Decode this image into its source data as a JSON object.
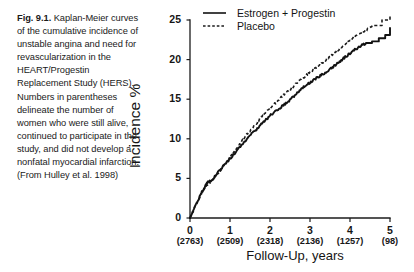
{
  "caption": {
    "figure_label": "Fig. 9.1.",
    "text": "Kaplan-Meier curves of the cumulative incidence of unstable angina and need for revascularization in the HEART/Progestin Replacement Study (HERS). Numbers in parentheses delineate the number of women who were still alive, continued to participate in the study, and did not develop a nonfatal myocardial infarction. (From Hulley et al. 1998)"
  },
  "chart_data": {
    "type": "line",
    "title": "",
    "xlabel": "Follow-Up,  years",
    "ylabel": "Incidence %",
    "xlim": [
      0,
      5
    ],
    "ylim": [
      0,
      25
    ],
    "xticks": [
      0,
      1,
      2,
      3,
      4,
      5
    ],
    "xtick_labels": [
      "0",
      "1",
      "2",
      "3",
      "4",
      "5"
    ],
    "yticks": [
      0,
      5,
      10,
      15,
      20,
      25
    ],
    "ytick_labels": [
      "0",
      "5",
      "10",
      "15",
      "20",
      "25"
    ],
    "grid": false,
    "legend_position": "top-center",
    "at_risk_label_row": [
      "(2763)",
      "(2509)",
      "(2318)",
      "(2136)",
      "(1257)",
      "(98)"
    ],
    "series": [
      {
        "name": "Estrogen + Progestin",
        "style": "solid",
        "x": [
          0.0,
          0.1,
          0.2,
          0.3,
          0.38,
          0.45,
          0.52,
          0.6,
          0.7,
          0.8,
          0.9,
          1.0,
          1.1,
          1.2,
          1.3,
          1.4,
          1.5,
          1.6,
          1.7,
          1.8,
          1.9,
          2.0,
          2.1,
          2.2,
          2.3,
          2.4,
          2.5,
          2.6,
          2.7,
          2.8,
          2.9,
          3.0,
          3.1,
          3.2,
          3.3,
          3.4,
          3.5,
          3.6,
          3.7,
          3.8,
          3.9,
          4.0,
          4.1,
          4.2,
          4.3,
          4.4,
          4.5,
          4.6,
          4.7,
          4.8,
          4.9,
          5.0
        ],
        "y": [
          0.0,
          1.1,
          2.2,
          3.3,
          4.0,
          4.6,
          4.7,
          5.1,
          5.8,
          6.4,
          6.9,
          7.5,
          8.1,
          8.7,
          9.3,
          9.9,
          10.4,
          10.9,
          11.4,
          11.9,
          12.4,
          12.9,
          13.3,
          13.7,
          14.1,
          14.5,
          14.9,
          15.4,
          15.9,
          16.4,
          16.8,
          17.1,
          17.5,
          17.8,
          18.1,
          18.4,
          18.8,
          19.2,
          19.6,
          20.0,
          20.4,
          20.8,
          21.2,
          21.5,
          21.8,
          22.1,
          22.2,
          22.5,
          22.6,
          23.0,
          23.1,
          24.0
        ]
      },
      {
        "name": "Placebo",
        "style": "dashed",
        "x": [
          0.0,
          0.1,
          0.2,
          0.3,
          0.38,
          0.45,
          0.52,
          0.6,
          0.7,
          0.8,
          0.9,
          1.0,
          1.1,
          1.2,
          1.3,
          1.4,
          1.5,
          1.6,
          1.7,
          1.8,
          1.9,
          2.0,
          2.1,
          2.2,
          2.3,
          2.4,
          2.5,
          2.6,
          2.7,
          2.8,
          2.9,
          3.0,
          3.1,
          3.2,
          3.3,
          3.4,
          3.5,
          3.6,
          3.7,
          3.8,
          3.9,
          4.0,
          4.1,
          4.2,
          4.3,
          4.4,
          4.5,
          4.6,
          4.7,
          4.8,
          4.9,
          5.0
        ],
        "y": [
          0.0,
          1.1,
          2.2,
          3.2,
          3.9,
          4.3,
          4.6,
          5.0,
          5.7,
          6.3,
          6.9,
          7.6,
          8.3,
          9.0,
          9.7,
          10.4,
          11.0,
          11.6,
          12.2,
          12.8,
          13.3,
          13.8,
          14.3,
          14.8,
          15.3,
          15.8,
          16.2,
          16.7,
          17.2,
          17.6,
          18.0,
          18.4,
          18.8,
          19.2,
          19.6,
          20.0,
          20.4,
          20.8,
          21.2,
          21.6,
          22.0,
          22.4,
          22.8,
          23.1,
          23.4,
          23.7,
          24.0,
          24.3,
          24.6,
          24.9,
          25.1,
          25.5
        ]
      }
    ]
  },
  "legend": {
    "items": [
      {
        "label": "Estrogen  + Progestin",
        "style": "solid"
      },
      {
        "label": "Placebo",
        "style": "dashed"
      }
    ]
  }
}
